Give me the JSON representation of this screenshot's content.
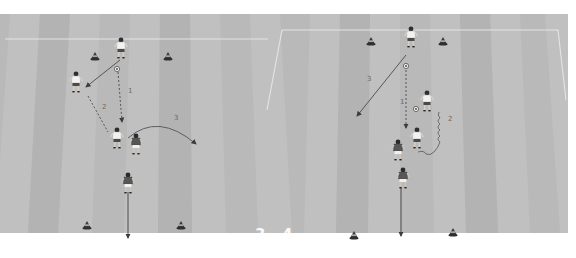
{
  "figure_labels": [
    "3",
    "4"
  ],
  "colors": {
    "field_base": "#b9b9b9",
    "stripe_light": "#c2c2c2",
    "stripe_dark": "#adadad",
    "line_white": "#e6e6e6",
    "arrow_dark": "#4a4a4a",
    "cone": "#3a3a3a",
    "player_white_shirt": "#f2f2f2",
    "player_dark_shirt": "#5a5a5a"
  },
  "diagrams": [
    {
      "id": "diagram-3",
      "label": "3",
      "step_labels": [
        "1",
        "2",
        "3"
      ],
      "cones": 4,
      "players": [
        "white-top",
        "white-left",
        "white-center",
        "dark-defender",
        "dark-bottom"
      ],
      "actions": [
        {
          "step": "1",
          "type": "pass",
          "style": "dashed"
        },
        {
          "step": "2",
          "type": "run",
          "style": "dashed"
        },
        {
          "step": "3",
          "type": "lofted-pass",
          "style": "curved"
        }
      ]
    },
    {
      "id": "diagram-4",
      "label": "4",
      "step_labels": [
        "1",
        "2",
        "3"
      ],
      "cones": 4,
      "players": [
        "white-top",
        "white-dribbler",
        "dark-defender",
        "dark-bottom"
      ],
      "actions": [
        {
          "step": "1",
          "type": "pass",
          "style": "dashed"
        },
        {
          "step": "2",
          "type": "dribble",
          "style": "wavy"
        },
        {
          "step": "3",
          "type": "run",
          "style": "solid"
        }
      ]
    }
  ]
}
